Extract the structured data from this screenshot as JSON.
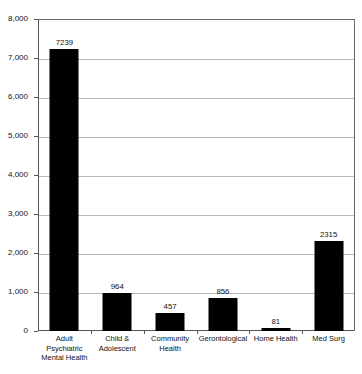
{
  "chart_data": {
    "type": "bar",
    "title": "",
    "xlabel": "",
    "ylabel": "",
    "ylim": [
      0,
      8000
    ],
    "ytick_values": [
      0,
      1000,
      2000,
      3000,
      4000,
      5000,
      6000,
      7000,
      8000
    ],
    "ytick_labels": [
      "0",
      "1,000",
      "2,000",
      "3,000",
      "4,000",
      "5,000",
      "6,000",
      "7,000",
      "8,000"
    ],
    "grid": true,
    "grid_axis": "y",
    "legend": false,
    "bar_color": "#000000",
    "categories": [
      "Adult Psychiatric Mental Health",
      "Child & Adolescent",
      "Community Health",
      "Gerontological",
      "Home Health",
      "Med Surg"
    ],
    "category_lines": [
      [
        "Adult",
        "Psychiatric",
        "Mental Health"
      ],
      [
        "Child &",
        "Adolescent"
      ],
      [
        "Community",
        "Health"
      ],
      [
        "Gerontological"
      ],
      [
        "Home Health"
      ],
      [
        "Med Surg"
      ]
    ],
    "values": [
      7239,
      964,
      457,
      856,
      81,
      2315
    ],
    "value_labels": [
      "7239",
      "964",
      "457",
      "856",
      "81",
      "2315"
    ]
  }
}
